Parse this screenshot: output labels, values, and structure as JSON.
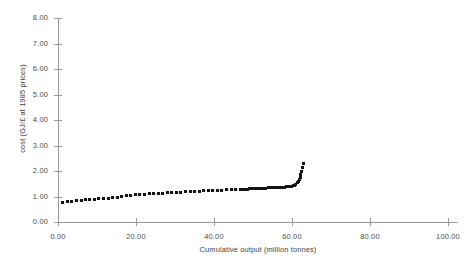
{
  "chart_data": {
    "type": "scatter",
    "title": "",
    "xlabel": "Cumulative output (million tonnes)",
    "ylabel": "cost (GJ/£ at 1985 prices)",
    "xlim": [
      0.0,
      100.0
    ],
    "ylim": [
      0.0,
      8.0
    ],
    "xticks": [
      "0.00",
      "20.00",
      "40.00",
      "60.00",
      "80.00",
      "100.00"
    ],
    "xtick_values": [
      0.0,
      20.0,
      40.0,
      60.0,
      80.0,
      100.0
    ],
    "yticks": [
      "0.00",
      "1.00",
      "2.00",
      "3.00",
      "4.00",
      "5.00",
      "6.00",
      "7.00",
      "8.00"
    ],
    "ytick_values": [
      0.0,
      1.0,
      2.0,
      3.0,
      4.0,
      5.0,
      6.0,
      7.0,
      8.0
    ],
    "grid": false,
    "legend": "none",
    "marker": "filled-square",
    "marker_color": "#141414",
    "axis_color": "#9a9a9a",
    "series": [
      {
        "name": "cost curve",
        "x": [
          1.2,
          2.4,
          3.5,
          4.7,
          5.9,
          7.0,
          8.2,
          9.4,
          10.5,
          11.7,
          12.9,
          14.0,
          15.2,
          16.4,
          17.5,
          18.7,
          19.9,
          21.0,
          22.2,
          23.4,
          24.5,
          25.7,
          26.9,
          28.0,
          29.2,
          30.4,
          31.5,
          32.7,
          33.9,
          35.0,
          36.2,
          37.4,
          38.5,
          39.7,
          40.9,
          42.0,
          43.2,
          44.4,
          45.5,
          46.7,
          47.3,
          47.9,
          48.5,
          49.1,
          49.7,
          50.3,
          50.9,
          51.5,
          52.1,
          52.7,
          53.3,
          53.9,
          54.5,
          55.1,
          55.7,
          56.3,
          56.9,
          57.5,
          58.1,
          58.7,
          59.3,
          59.9,
          60.3,
          60.7,
          61.0,
          61.3,
          61.6,
          61.9,
          62.1,
          62.3,
          62.5,
          62.7,
          62.9
        ],
        "y": [
          0.77,
          0.8,
          0.82,
          0.84,
          0.85,
          0.87,
          0.88,
          0.9,
          0.91,
          0.93,
          0.94,
          0.96,
          0.98,
          1.0,
          1.02,
          1.04,
          1.06,
          1.07,
          1.09,
          1.1,
          1.11,
          1.12,
          1.13,
          1.14,
          1.15,
          1.16,
          1.17,
          1.18,
          1.19,
          1.2,
          1.21,
          1.22,
          1.23,
          1.23,
          1.24,
          1.25,
          1.26,
          1.27,
          1.27,
          1.28,
          1.28,
          1.29,
          1.29,
          1.3,
          1.3,
          1.31,
          1.31,
          1.32,
          1.32,
          1.33,
          1.33,
          1.34,
          1.34,
          1.35,
          1.35,
          1.36,
          1.36,
          1.37,
          1.37,
          1.38,
          1.39,
          1.4,
          1.42,
          1.45,
          1.49,
          1.54,
          1.6,
          1.68,
          1.76,
          1.86,
          1.97,
          2.12,
          2.29
        ]
      }
    ]
  }
}
